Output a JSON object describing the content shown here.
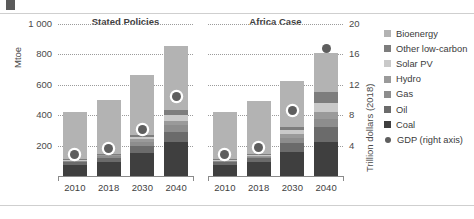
{
  "chart_data": {
    "type": "bar",
    "title": "",
    "panels": [
      "Stated Policies",
      "Africa Case"
    ],
    "categories": [
      "2010",
      "2018",
      "2030",
      "2040"
    ],
    "ylabel": "Mtoe",
    "ylim": [
      0,
      1000
    ],
    "yticks": [
      "200",
      "400",
      "600",
      "800",
      "1 000"
    ],
    "ytick_values": [
      200,
      400,
      600,
      800,
      1000
    ],
    "y2label": "Trillion dollars (2018)",
    "y2lim": [
      0,
      20
    ],
    "y2ticks": [
      "4",
      "8",
      "12",
      "16",
      "20"
    ],
    "y2tick_values": [
      4,
      8,
      12,
      16,
      20
    ],
    "grid": true,
    "legend_position": "right",
    "stack_order_bottom_to_top": [
      "Coal",
      "Oil",
      "Gas",
      "Hydro",
      "Solar PV",
      "Other low-carbon",
      "Bioenergy"
    ],
    "series": [
      {
        "name": "Bioenergy",
        "color": "#b3b3b3",
        "stated_policies": [
          310,
          355,
          395,
          425
        ],
        "africa_case": [
          310,
          352,
          300,
          255
        ]
      },
      {
        "name": "Other low-carbon",
        "color": "#7d7d7d",
        "stated_policies": [
          2,
          3,
          12,
          30
        ],
        "africa_case": [
          2,
          3,
          22,
          75
        ]
      },
      {
        "name": "Solar PV",
        "color": "#c9c9c9",
        "stated_policies": [
          1,
          2,
          14,
          38
        ],
        "africa_case": [
          1,
          2,
          26,
          62
        ]
      },
      {
        "name": "Hydro",
        "color": "#9a9a9a",
        "stated_policies": [
          9,
          11,
          20,
          30
        ],
        "africa_case": [
          9,
          11,
          24,
          40
        ]
      },
      {
        "name": "Gas",
        "color": "#8d8d8d",
        "stated_policies": [
          8,
          10,
          24,
          42
        ],
        "africa_case": [
          8,
          10,
          30,
          58
        ]
      },
      {
        "name": "Oil",
        "color": "#6b6b6b",
        "stated_policies": [
          18,
          24,
          48,
          70
        ],
        "africa_case": [
          18,
          24,
          60,
          98
        ]
      },
      {
        "name": "Coal",
        "color": "#3f3f3f",
        "stated_policies": [
          72,
          95,
          152,
          222
        ],
        "africa_case": [
          72,
          93,
          160,
          222
        ]
      }
    ],
    "gdp": {
      "name": "GDP (right axis)",
      "unit": "Trillion dollars (2018)",
      "color": "#5e5e5e",
      "stated_policies": [
        2.8,
        3.6,
        6.1,
        10.4
      ],
      "africa_case": [
        2.8,
        3.7,
        8.6,
        16.8
      ]
    },
    "legend": [
      {
        "label": "Bioenergy",
        "marker": "square",
        "color": "#b3b3b3"
      },
      {
        "label": "Other low-carbon",
        "marker": "square",
        "color": "#7d7d7d"
      },
      {
        "label": "Solar PV",
        "marker": "square",
        "color": "#c9c9c9"
      },
      {
        "label": "Hydro",
        "marker": "square",
        "color": "#9a9a9a"
      },
      {
        "label": "Gas",
        "marker": "square",
        "color": "#8d8d8d"
      },
      {
        "label": "Oil",
        "marker": "square",
        "color": "#6b6b6b"
      },
      {
        "label": "Coal",
        "marker": "square",
        "color": "#3f3f3f"
      },
      {
        "label": "GDP (right axis)",
        "marker": "circle",
        "color": "#5e5e5e"
      }
    ]
  }
}
